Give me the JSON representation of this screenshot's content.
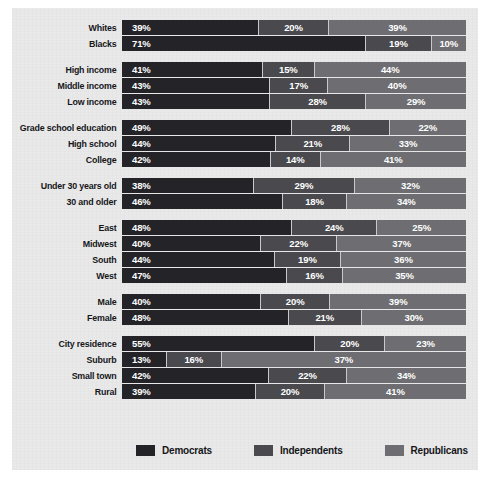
{
  "chart_data": {
    "type": "bar",
    "subtype": "stacked-horizontal-100",
    "title": "",
    "xlabel": "",
    "ylabel": "",
    "xlim": [
      0,
      100
    ],
    "grid": false,
    "legend_position": "bottom",
    "series": [
      {
        "name": "Democrats",
        "color": "#242428",
        "values": [
          39,
          71,
          41,
          43,
          43,
          49,
          44,
          42,
          38,
          46,
          48,
          40,
          44,
          47,
          40,
          48,
          55,
          13,
          42,
          39
        ]
      },
      {
        "name": "Independents",
        "color": "#4a4a4e",
        "values": [
          20,
          19,
          15,
          17,
          28,
          28,
          21,
          14,
          29,
          18,
          24,
          22,
          19,
          16,
          20,
          21,
          20,
          16,
          22,
          20
        ]
      },
      {
        "name": "Republicans",
        "color": "#6e6e72",
        "values": [
          39,
          10,
          44,
          40,
          29,
          22,
          33,
          41,
          32,
          34,
          25,
          37,
          36,
          35,
          39,
          30,
          23,
          37,
          34,
          41
        ]
      }
    ],
    "categories": [
      "Whites",
      "Blacks",
      "High income",
      "Middle income",
      "Low income",
      "Grade school education",
      "High school",
      "College",
      "Under 30 years old",
      "30 and older",
      "East",
      "Midwest",
      "South",
      "West",
      "Male",
      "Female",
      "City residence",
      "Suburb",
      "Small town",
      "Rural"
    ],
    "groups": [
      {
        "name": "race",
        "rows": [
          {
            "label": "Whites",
            "democrats": "39%",
            "independents": "20%",
            "republicans": "39%",
            "d": 39,
            "i": 20,
            "r": 39
          },
          {
            "label": "Blacks",
            "democrats": "71%",
            "independents": "19%",
            "republicans": "10%",
            "d": 71,
            "i": 19,
            "r": 10
          }
        ]
      },
      {
        "name": "income",
        "rows": [
          {
            "label": "High income",
            "democrats": "41%",
            "independents": "15%",
            "republicans": "44%",
            "d": 41,
            "i": 15,
            "r": 44
          },
          {
            "label": "Middle income",
            "democrats": "43%",
            "independents": "17%",
            "republicans": "40%",
            "d": 43,
            "i": 17,
            "r": 40
          },
          {
            "label": "Low income",
            "democrats": "43%",
            "independents": "28%",
            "republicans": "29%",
            "d": 43,
            "i": 28,
            "r": 29
          }
        ]
      },
      {
        "name": "education",
        "rows": [
          {
            "label": "Grade school education",
            "democrats": "49%",
            "independents": "28%",
            "republicans": "22%",
            "d": 49,
            "i": 28,
            "r": 22
          },
          {
            "label": "High school",
            "democrats": "44%",
            "independents": "21%",
            "republicans": "33%",
            "d": 44,
            "i": 21,
            "r": 33
          },
          {
            "label": "College",
            "democrats": "42%",
            "independents": "14%",
            "republicans": "41%",
            "d": 42,
            "i": 14,
            "r": 41
          }
        ]
      },
      {
        "name": "age",
        "rows": [
          {
            "label": "Under 30 years old",
            "democrats": "38%",
            "independents": "29%",
            "republicans": "32%",
            "d": 38,
            "i": 29,
            "r": 32
          },
          {
            "label": "30 and older",
            "democrats": "46%",
            "independents": "18%",
            "republicans": "34%",
            "d": 46,
            "i": 18,
            "r": 34
          }
        ]
      },
      {
        "name": "region",
        "rows": [
          {
            "label": "East",
            "democrats": "48%",
            "independents": "24%",
            "republicans": "25%",
            "d": 48,
            "i": 24,
            "r": 25
          },
          {
            "label": "Midwest",
            "democrats": "40%",
            "independents": "22%",
            "republicans": "37%",
            "d": 40,
            "i": 22,
            "r": 37
          },
          {
            "label": "South",
            "democrats": "44%",
            "independents": "19%",
            "republicans": "36%",
            "d": 44,
            "i": 19,
            "r": 36
          },
          {
            "label": "West",
            "democrats": "47%",
            "independents": "16%",
            "republicans": "35%",
            "d": 47,
            "i": 16,
            "r": 35
          }
        ]
      },
      {
        "name": "gender",
        "rows": [
          {
            "label": "Male",
            "democrats": "40%",
            "independents": "20%",
            "republicans": "39%",
            "d": 40,
            "i": 20,
            "r": 39
          },
          {
            "label": "Female",
            "democrats": "48%",
            "independents": "21%",
            "republicans": "30%",
            "d": 48,
            "i": 21,
            "r": 30
          }
        ]
      },
      {
        "name": "residence",
        "rows": [
          {
            "label": "City residence",
            "democrats": "55%",
            "independents": "20%",
            "republicans": "23%",
            "d": 55,
            "i": 20,
            "r": 23
          },
          {
            "label": "Suburb",
            "democrats": "13%",
            "independents": "16%",
            "republicans": "37%",
            "d": 13,
            "i": 16,
            "r": 71
          },
          {
            "label": "Small town",
            "democrats": "42%",
            "independents": "22%",
            "republicans": "34%",
            "d": 42,
            "i": 22,
            "r": 34
          },
          {
            "label": "Rural",
            "democrats": "39%",
            "independents": "20%",
            "republicans": "41%",
            "d": 39,
            "i": 20,
            "r": 41
          }
        ]
      }
    ],
    "legend": [
      {
        "label": "Democrats",
        "color": "#242428"
      },
      {
        "label": "Independents",
        "color": "#4a4a4e"
      },
      {
        "label": "Republicans",
        "color": "#6e6e72"
      }
    ]
  }
}
